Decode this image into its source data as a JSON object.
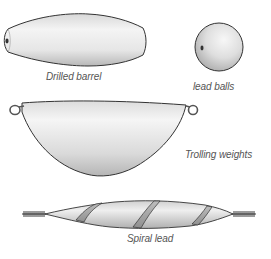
{
  "figure": {
    "items": [
      {
        "id": "drilled-barrel",
        "label": "Drilled barrel"
      },
      {
        "id": "lead-balls",
        "label": "lead balls"
      },
      {
        "id": "trolling-weights",
        "label": "Trolling weights"
      },
      {
        "id": "spiral-lead",
        "label": "Spiral lead"
      }
    ]
  },
  "colors": {
    "background": "#ffffff",
    "outline": "#333333",
    "body_light": "#f2f2f2",
    "body_mid": "#d6d6d6",
    "body_dark": "#a8a8a8",
    "label_text": "#555555"
  }
}
